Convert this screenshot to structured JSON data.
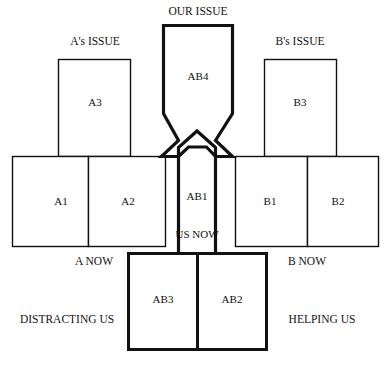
{
  "diagram": {
    "type": "negotiation-issue-map",
    "title": "OUR ISSUE",
    "stroke_color": "#111111",
    "fill_color": "#ffffff",
    "thick_stroke_width": 3.2,
    "thin_stroke_width": 1.3,
    "outer_labels": {
      "top_center": "OUR ISSUE",
      "top_left": "A's ISSUE",
      "top_right": "B's ISSUE",
      "mid_left": "A NOW",
      "mid_right": "B NOW",
      "bottom_left": "DISTRACTING US",
      "bottom_right": "HELPING US"
    },
    "boxes": [
      {
        "id": "A3",
        "label": "A3",
        "group": "a-issue",
        "emphasis": "thin"
      },
      {
        "id": "B3",
        "label": "B3",
        "group": "b-issue",
        "emphasis": "thin"
      },
      {
        "id": "A1",
        "label": "A1",
        "group": "a-now",
        "emphasis": "thin"
      },
      {
        "id": "A2",
        "label": "A2",
        "group": "a-now",
        "emphasis": "thin"
      },
      {
        "id": "B1",
        "label": "B1",
        "group": "b-now",
        "emphasis": "thin"
      },
      {
        "id": "B2",
        "label": "B2",
        "group": "b-now",
        "emphasis": "thin"
      },
      {
        "id": "AB4",
        "label": "AB4",
        "group": "our-issue",
        "emphasis": "thick"
      },
      {
        "id": "AB1",
        "label": "AB1",
        "group": "us-now",
        "emphasis": "thick"
      },
      {
        "id": "AB3",
        "label": "AB3",
        "group": "distracting",
        "emphasis": "thick"
      },
      {
        "id": "AB2",
        "label": "AB2",
        "group": "helping",
        "emphasis": "thick"
      }
    ],
    "inner_notes": {
      "us_now": "US NOW"
    }
  }
}
